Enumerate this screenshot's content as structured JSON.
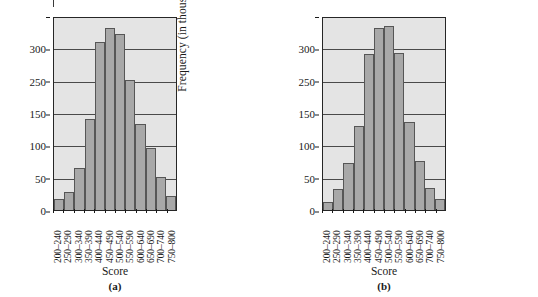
{
  "figure": {
    "panels": [
      {
        "caption": "(a)",
        "xlabel": "Score",
        "ylabel": "Frequency (in thousands)"
      },
      {
        "caption": "(b)",
        "xlabel": "Score",
        "ylabel": "Frequency (in thousands)"
      }
    ]
  },
  "chart_data": [
    {
      "type": "bar",
      "title": "",
      "subtitle": "(a)",
      "xlabel": "Score",
      "ylabel": "Frequency (in thousands)",
      "categories": [
        "200–240",
        "250–290",
        "300–340",
        "350–390",
        "400–440",
        "450–490",
        "500–540",
        "550–590",
        "600–640",
        "650–690",
        "700–740",
        "750–800"
      ],
      "values": [
        17,
        28,
        66,
        142,
        262,
        284,
        275,
        203,
        134,
        97,
        51,
        22
      ],
      "ylim": [
        0,
        300
      ],
      "yticks": [
        0,
        50,
        100,
        150,
        250,
        300
      ],
      "ytick_labels": [
        "0",
        "50",
        "100",
        "150",
        "250",
        "300"
      ],
      "ytick_values": [
        0,
        50,
        100,
        150,
        200,
        250,
        300
      ],
      "grid": true,
      "legend": "none",
      "bar_color": "#a8a8a8",
      "plot_background": "#e4e4e4"
    },
    {
      "type": "bar",
      "title": "",
      "subtitle": "(b)",
      "xlabel": "Score",
      "ylabel": "Frequency (in thousands)",
      "categories": [
        "200–240",
        "250–290",
        "300–340",
        "350–390",
        "400–440",
        "450–490",
        "500–540",
        "550–590",
        "600–640",
        "650–690",
        "700–740",
        "750–800"
      ],
      "values": [
        13,
        33,
        74,
        132,
        243,
        285,
        287,
        246,
        137,
        76,
        35,
        17
      ],
      "ylim": [
        0,
        300
      ],
      "yticks": [
        0,
        50,
        100,
        150,
        250,
        300
      ],
      "ytick_labels": [
        "0",
        "50",
        "100",
        "150",
        "250",
        "300"
      ],
      "ytick_values": [
        0,
        50,
        100,
        150,
        200,
        250,
        300
      ],
      "grid": true,
      "legend": "none",
      "bar_color": "#a8a8a8",
      "plot_background": "#e4e4e4"
    }
  ]
}
